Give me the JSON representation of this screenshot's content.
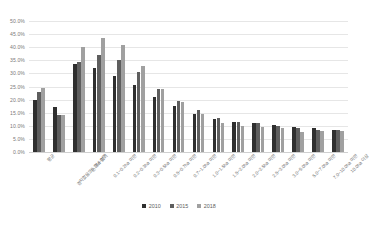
{
  "chart_data": {
    "type": "bar",
    "title": "",
    "xlabel": "",
    "ylabel": "",
    "ylim": [
      0,
      50
    ],
    "ytick_labels": [
      "50.0%",
      "45.0%",
      "40.0%",
      "35.0%",
      "30.0%",
      "25.0%",
      "20.0%",
      "15.0%",
      "10.0%",
      "5.0%",
      "0.0%"
    ],
    "ytick_values": [
      50,
      45,
      40,
      35,
      30,
      25,
      20,
      15,
      10,
      5,
      0
    ],
    "grid": true,
    "legend_position": "bottom",
    "categories": [
      "평균",
      "경지없음또는 알수없기",
      "0.1ha 미만",
      "0.1~0.2ha 미만",
      "0.2~0.3ha 미만",
      "0.3~0.5ha 미만",
      "0.5~0.7ha 미만",
      "0.7~1.0ha 미만",
      "1.0~1.5ha 미만",
      "1.5~2.0ha 미만",
      "2.0~2.5ha 미만",
      "2.5~3.0ha 미만",
      "3.0~5.0ha 미만",
      "5.0~7.0ha 미만",
      "7.0~10.0ha 미만",
      "10.0ha 이상"
    ],
    "series": [
      {
        "name": "2010",
        "color": "#2f2f2f",
        "values": [
          20.0,
          17.0,
          33.5,
          32.0,
          29.0,
          25.5,
          21.0,
          17.5,
          14.5,
          12.5,
          11.5,
          11.0,
          10.5,
          9.5,
          9.0,
          8.5
        ]
      },
      {
        "name": "2015",
        "color": "#5e5e5e",
        "values": [
          22.8,
          14.0,
          34.5,
          37.0,
          35.0,
          30.5,
          24.0,
          19.5,
          16.0,
          13.0,
          11.5,
          11.0,
          10.0,
          9.0,
          8.5,
          8.5
        ]
      },
      {
        "name": "2018",
        "color": "#a0a0a0",
        "values": [
          24.5,
          14.0,
          40.0,
          43.5,
          41.0,
          33.0,
          24.0,
          19.0,
          14.5,
          11.0,
          10.0,
          9.5,
          9.0,
          7.5,
          8.0,
          8.0
        ]
      }
    ]
  },
  "legend": {
    "items": [
      {
        "label": "2010"
      },
      {
        "label": "2015"
      },
      {
        "label": "2018"
      }
    ]
  }
}
